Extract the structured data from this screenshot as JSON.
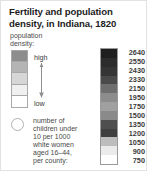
{
  "figure": {
    "title": "Fertility and population density, in Indiana, 1820",
    "background_color": "#ffffff",
    "border_color": "#e2e2e2"
  },
  "density_legend": {
    "label": "population\ndensity:",
    "label_line_1": "population",
    "label_line_2": "density:",
    "high_label": "high",
    "low_label": "low",
    "arrow_icon": "down-arrow-icon",
    "arrow_direction": "down",
    "swatches": [
      {
        "value": "high",
        "color": "#8d8d8d"
      },
      {
        "value": "",
        "color": "#b4b4b4"
      },
      {
        "value": "",
        "color": "#d6d6d6"
      },
      {
        "value": "",
        "color": "#f0f0f0"
      },
      {
        "value": "low",
        "color": "#ffffff"
      }
    ]
  },
  "circle_legend": {
    "symbol_icon": "circle-outline-icon",
    "text": "number of children under 10 per 1000 white women aged 16–44, per county:",
    "lines": [
      "number of",
      "children under",
      "10 per 1000",
      "white women",
      "aged 16–44,",
      "per county:"
    ]
  },
  "chart_data": {
    "type": "heatmap",
    "title": "Fertility and population density, in Indiana, 1820",
    "xlabel": "",
    "ylabel": "number of children under 10 per 1000 white women aged 16–44, per county",
    "legend_position": "right",
    "grid": false,
    "colorbar": {
      "orientation": "vertical",
      "tick_labels": [
        2640,
        2550,
        2430,
        2330,
        2150,
        1950,
        1750,
        1500,
        1350,
        1200,
        1050,
        900,
        750
      ],
      "range": [
        750,
        2640
      ],
      "classes": [
        {
          "label": "2640",
          "color": "#1f1f1f"
        },
        {
          "label": "2550",
          "color": "#2c2c2c"
        },
        {
          "label": "2430",
          "color": "#353535"
        },
        {
          "label": "2330",
          "color": "#4a4a4a"
        },
        {
          "label": "2150",
          "color": "#6e6e6e"
        },
        {
          "label": "1950",
          "color": "#8c8c8c"
        },
        {
          "label": "1750",
          "color": "#a0a0a0"
        },
        {
          "label": "1500",
          "color": "#8a8a8a"
        },
        {
          "label": "1350",
          "color": "#4e4e4e"
        },
        {
          "label": "1200",
          "color": "#3f3f3f"
        },
        {
          "label": "1050",
          "color": "#bdbdbd"
        },
        {
          "label": "900",
          "color": "#ebebeb"
        },
        {
          "label": "750",
          "color": "#ffffff"
        }
      ]
    },
    "secondary_legend": {
      "name": "population density",
      "type": "ordinal-ramp",
      "high_label": "high",
      "low_label": "low",
      "colors": [
        "#8d8d8d",
        "#b4b4b4",
        "#d6d6d6",
        "#f0f0f0",
        "#ffffff"
      ]
    }
  }
}
